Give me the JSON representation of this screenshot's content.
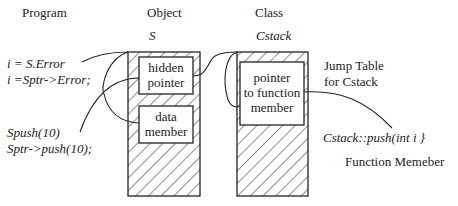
{
  "headers": {
    "program": "Program",
    "object": "Object",
    "class": "Class"
  },
  "object": {
    "name": "S",
    "hidden_pointer": [
      "hidden",
      "pointer"
    ],
    "data_member": [
      "data",
      "member"
    ]
  },
  "class": {
    "name": "Cstack",
    "pointer_box": [
      "pointer",
      "to function",
      "member"
    ]
  },
  "program_lines": {
    "line1": "i = S.Error",
    "line2": "i =Sptr->Error;",
    "line3": "Spush(10)",
    "line4": "Sptr->push(10);"
  },
  "annotations": {
    "jump_table_1": "Jump Table",
    "jump_table_2": "for Cstack",
    "function_signature": "Cstack::push(int i }",
    "function_label": "Function Memeber"
  },
  "colors": {
    "stroke": "#222222",
    "background": "#ffffff"
  }
}
